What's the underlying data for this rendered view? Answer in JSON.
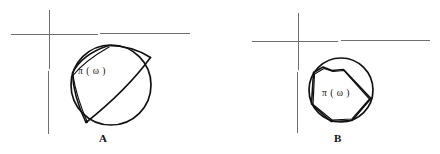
{
  "figure": {
    "type": "mathematical-diagram",
    "background_color": "#ffffff",
    "width": 440,
    "height": 154,
    "axis_color": "#6f6f6f",
    "curve_color": "#111111"
  },
  "panels": [
    {
      "id": "A",
      "label": "A",
      "region_label": "π ( ω )",
      "axes": {
        "origin_x": 49,
        "origin_y": 34,
        "horizontal_from_x": 11,
        "horizontal_to_x": 190,
        "vertical_from_y": 10,
        "vertical_to_y": 134
      },
      "circle": {
        "center_x": 111,
        "center_y": 85,
        "radius": 40
      },
      "description": "circle with curvilinear arcs bounding region pi(omega)"
    },
    {
      "id": "B",
      "label": "B",
      "region_label": "π ( ω )",
      "axes": {
        "origin_x": 298,
        "origin_y": 41,
        "horizontal_from_x": 252,
        "horizontal_to_x": 430,
        "vertical_from_y": 13,
        "vertical_to_y": 133
      },
      "circle": {
        "center_x": 341,
        "center_y": 90,
        "radius": 32
      },
      "description": "circle with inscribed polygon bounding region pi(omega)"
    }
  ],
  "geometry": {
    "panel_a": {
      "circle_path": "M 151,85 A 40,40 0 1 1 71,85 A 40,40 0 1 1 151,85",
      "arc_top_chord": "M 109,45 C 124,45 140,50 150,57",
      "arc_upper_left": "M 109,45 C 91,52 78,62 72,74",
      "arc_left_inner": "M 109,46 C 94,55 80,64 72,75",
      "arc_main_diagonal": "M 150,57 C 136,75 112,100 86,122",
      "arc_lower_left_a": "M 72,75 C 73,90 79,108 86,122",
      "arc_lower_left_b": "M 72,76 C 75,92 81,109 87,122"
    },
    "panel_b": {
      "circle_path": "M 373,90 A 32,32 0 1 1 309,90 A 32,32 0 1 1 373,90",
      "polygon_path": "M 314,72 L 323,67 L 332,70 L 343,69 L 371,98 L 352,120 L 331,121 L 312,104 Z",
      "polygon_inner_path": "M 314,73 L 324,68 L 333,71 L 343,70 L 370,99 L 352,119 L 332,120 L 313,104 Z"
    }
  }
}
